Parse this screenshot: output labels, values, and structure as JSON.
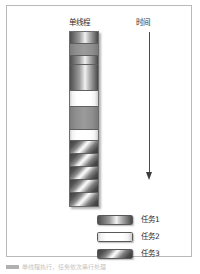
{
  "figure": {
    "title_thread_column": "单线程",
    "title_time_column": "时间",
    "caption": "单线程执行，任务依次串行处理"
  },
  "chart_data": {
    "type": "bar",
    "title": "单线程",
    "xlabel": "",
    "ylabel": "时间",
    "orientation": "vertical-timeline",
    "grid": false,
    "legend_position": "bottom-right",
    "categories": [
      "任务1",
      "任务2",
      "任务3"
    ],
    "series": [
      {
        "name": "单线程时间轴",
        "segments": [
          {
            "index": 1,
            "task": "任务1",
            "type": "t1",
            "height": 12
          },
          {
            "index": 2,
            "task": "",
            "type": "idle",
            "height": 12
          },
          {
            "index": 3,
            "task": "任务1",
            "type": "t1",
            "height": 9
          },
          {
            "index": 4,
            "task": "任务1",
            "type": "t1",
            "height": 26
          },
          {
            "index": 5,
            "task": "任务2",
            "type": "t2",
            "height": 16
          },
          {
            "index": 6,
            "task": "",
            "type": "idle",
            "height": 23
          },
          {
            "index": 7,
            "task": "任务2",
            "type": "t2",
            "height": 11
          },
          {
            "index": 8,
            "task": "任务3",
            "type": "t3",
            "height": 13
          },
          {
            "index": 9,
            "task": "任务3",
            "type": "t3",
            "height": 13
          },
          {
            "index": 10,
            "task": "任务3",
            "type": "t3",
            "height": 13
          },
          {
            "index": 11,
            "task": "任务3",
            "type": "t3",
            "height": 13
          },
          {
            "index": 12,
            "task": "任务3",
            "type": "t3",
            "height": 13
          }
        ]
      }
    ],
    "annotations": [
      {
        "name": "time-arrow",
        "label": "时间",
        "direction": "downward"
      }
    ]
  },
  "legend": {
    "items": [
      {
        "label": "任务1",
        "swatch": "t1",
        "color": "#6e6e6e"
      },
      {
        "label": "任务2",
        "swatch": "t2",
        "color": "#ffffff"
      },
      {
        "label": "任务3",
        "swatch": "t3",
        "color": "#555555"
      }
    ]
  },
  "colors": {
    "frame_border": "#b9b9b9",
    "bar_border": "#6d6d6d",
    "segment_divider": "#5f5f5f",
    "arrow": "#4a4a4a",
    "text": "#2b2b2b",
    "caption_text": "#c4c4c4"
  }
}
